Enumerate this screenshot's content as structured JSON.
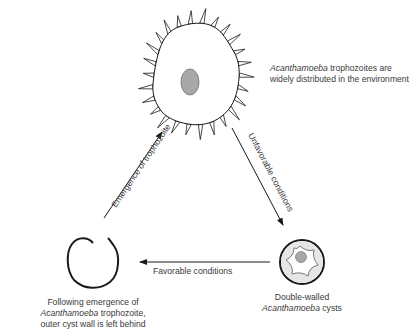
{
  "colors": {
    "line": "#1a1a1a",
    "nucleus": "#a8a8a8",
    "cyst_inner": "#e6e6e8",
    "text": "#3a3a3a"
  },
  "nodes": {
    "trophozoite": {
      "label_italic": "Acanthamoeba",
      "label_rest": " trophozoites are",
      "label_line2": "widely distributed in the environment"
    },
    "cyst": {
      "label_line1": "Double-walled",
      "label_italic": "Acanthamoeba",
      "label_rest": " cysts"
    },
    "empty_wall": {
      "label_line1": "Following emergence of",
      "label_italic": "Acanthamoeba",
      "label_rest": " trophozoite,",
      "label_line3": "outer cyst wall is left behind"
    }
  },
  "edges": {
    "unfavorable": "Unfavorable conditions",
    "favorable": "Favorable conditions",
    "emergence": "Emergence of trophozoite"
  }
}
